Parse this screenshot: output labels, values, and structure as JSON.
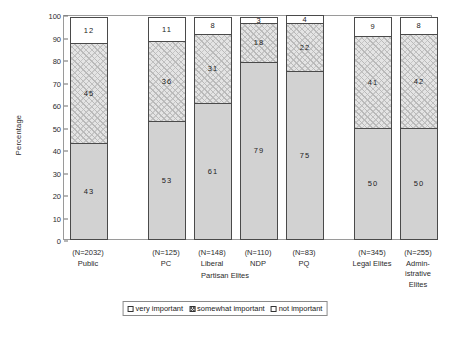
{
  "chart_data": {
    "type": "bar",
    "subtype": "stacked-percentage-column",
    "title": "",
    "xlabel": "Partisan Elites",
    "ylabel": "Percentage",
    "ylim": [
      0,
      100
    ],
    "yticks": [
      0,
      10,
      20,
      30,
      40,
      50,
      60,
      70,
      80,
      90,
      100
    ],
    "grid": false,
    "legend_position": "bottom",
    "categories": [
      "Public",
      "PC",
      "Liberal",
      "NDP",
      "PQ",
      "Legal Elites",
      "Admin-\nistrative\nElites"
    ],
    "category_labels": [
      {
        "n": "(N=2032)",
        "name": "Public"
      },
      {
        "n": "(N=125)",
        "name": "PC"
      },
      {
        "n": "(N=148)",
        "name": "Liberal"
      },
      {
        "n": "(N=110)",
        "name": "NDP"
      },
      {
        "n": "(N=83)",
        "name": "PQ"
      },
      {
        "n": "(N=345)",
        "name": "Legal Elites"
      },
      {
        "n": "(N=255)",
        "name": "Admin-\nistrative\nElites"
      }
    ],
    "series": [
      {
        "name": "very important",
        "values": [
          43,
          53,
          61,
          79,
          75,
          50,
          50
        ]
      },
      {
        "name": "somewhat important",
        "values": [
          45,
          36,
          31,
          18,
          22,
          41,
          42
        ]
      },
      {
        "name": "not important",
        "values": [
          12,
          11,
          8,
          3,
          4,
          9,
          8
        ]
      }
    ],
    "legend": [
      "very important",
      "somewhat important",
      "not important"
    ]
  },
  "axis": {
    "y_title": "Percentage",
    "x_title": "Partisan Elites"
  }
}
